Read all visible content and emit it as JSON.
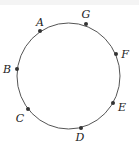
{
  "diagram": {
    "shape": "circle",
    "stroke_color": "#555555",
    "point_color": "#333333",
    "points": [
      {
        "label": "A",
        "x": 40,
        "y": 31,
        "lx": 40,
        "ly": 26
      },
      {
        "label": "G",
        "x": 86,
        "y": 24,
        "lx": 86,
        "ly": 18
      },
      {
        "label": "F",
        "x": 116,
        "y": 54,
        "lx": 125,
        "ly": 58
      },
      {
        "label": "B",
        "x": 17,
        "y": 69,
        "lx": 7,
        "ly": 73
      },
      {
        "label": "E",
        "x": 113,
        "y": 103,
        "lx": 122,
        "ly": 111
      },
      {
        "label": "C",
        "x": 28,
        "y": 109,
        "lx": 20,
        "ly": 122
      },
      {
        "label": "D",
        "x": 81,
        "y": 128,
        "lx": 80,
        "ly": 141
      }
    ]
  }
}
